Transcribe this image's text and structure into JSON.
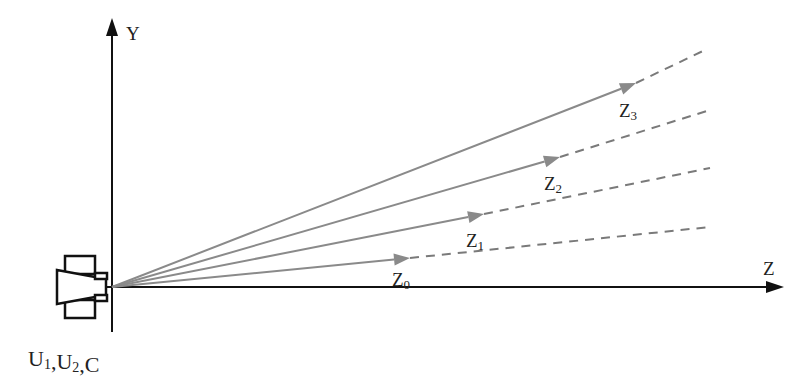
{
  "diagram": {
    "axes": {
      "y_label": "Y",
      "z_label": "Z",
      "origin": [
        112,
        287
      ],
      "y_axis": {
        "x": 112,
        "top": 20,
        "bottom": 330
      },
      "z_axis": {
        "y": 287,
        "left": 60,
        "right": 782
      }
    },
    "device_label": {
      "parts": [
        {
          "main": "U",
          "sub": "1"
        },
        {
          "main": ",U",
          "sub": "2"
        },
        {
          "main": ",C",
          "sub": ""
        }
      ]
    },
    "rays": [
      {
        "name": "Z",
        "sub": "0",
        "tip": [
          410,
          258
        ],
        "dash_end": [
          710,
          227
        ],
        "label_pos": [
          392,
          286
        ]
      },
      {
        "name": "Z",
        "sub": "1",
        "tip": [
          484,
          214
        ],
        "dash_end": [
          710,
          168
        ],
        "label_pos": [
          466,
          247
        ]
      },
      {
        "name": "Z",
        "sub": "2",
        "tip": [
          560,
          157
        ],
        "dash_end": [
          710,
          110
        ],
        "label_pos": [
          544,
          190
        ]
      },
      {
        "name": "Z",
        "sub": "3",
        "tip": [
          636,
          83
        ],
        "dash_end": [
          705,
          50
        ],
        "label_pos": [
          619,
          117
        ]
      }
    ],
    "colors": {
      "axis": "#111111",
      "ray": "#8a8a8a",
      "dash": "#7a7a7a",
      "device": "#111111"
    }
  }
}
